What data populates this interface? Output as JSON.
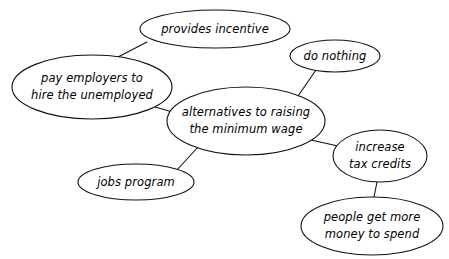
{
  "diagram": {
    "type": "concept-map",
    "background_color": "#ffffff",
    "stroke_color": "#111111",
    "text_color": "#000000",
    "nodes": [
      {
        "id": "provides-incentive",
        "label": "provides incentive",
        "lines": [
          "provides incentive"
        ],
        "cx": 215,
        "cy": 29,
        "rx": 75,
        "ry": 19,
        "font_size": 11.5
      },
      {
        "id": "do-nothing",
        "label": "do nothing",
        "lines": [
          "do nothing"
        ],
        "cx": 335,
        "cy": 56,
        "rx": 45,
        "ry": 16,
        "font_size": 11.5
      },
      {
        "id": "pay-employers",
        "label": "pay employers to hire the unemployed",
        "lines": [
          "pay employers to",
          "hire the unemployed"
        ],
        "cx": 92,
        "cy": 87,
        "rx": 80,
        "ry": 32,
        "font_size": 11.5
      },
      {
        "id": "alternatives-center",
        "label": "alternatives to raising the minimum wage",
        "lines": [
          "alternatives to raising",
          "the minimum wage"
        ],
        "cx": 246,
        "cy": 121,
        "rx": 79,
        "ry": 34,
        "font_size": 11.5
      },
      {
        "id": "increase-tax-credits",
        "label": "increase tax credits",
        "lines": [
          "increase",
          "tax credits"
        ],
        "cx": 380,
        "cy": 156,
        "rx": 47,
        "ry": 26,
        "font_size": 11.5
      },
      {
        "id": "jobs-program",
        "label": "jobs program",
        "lines": [
          "jobs program"
        ],
        "cx": 136,
        "cy": 182,
        "rx": 58,
        "ry": 18,
        "font_size": 11.5
      },
      {
        "id": "people-get-more-money",
        "label": "people get more money to spend",
        "lines": [
          "people get more",
          "money to spend"
        ],
        "cx": 372,
        "cy": 226,
        "rx": 71,
        "ry": 29,
        "font_size": 11.5
      }
    ],
    "edges": [
      {
        "id": "edge-pay-employers-to-provides-incentive",
        "from": "pay-employers",
        "to": "provides-incentive",
        "x1": 118,
        "y1": 57,
        "x2": 147,
        "y2": 42
      },
      {
        "id": "edge-pay-employers-to-center",
        "from": "pay-employers",
        "to": "alternatives-center",
        "x1": 155,
        "y1": 107,
        "x2": 176,
        "y2": 113
      },
      {
        "id": "edge-center-to-do-nothing",
        "from": "alternatives-center",
        "to": "do-nothing",
        "x1": 296,
        "y1": 99,
        "x2": 316,
        "y2": 70
      },
      {
        "id": "edge-center-to-jobs-program",
        "from": "alternatives-center",
        "to": "jobs-program",
        "x1": 199,
        "y1": 146,
        "x2": 176,
        "y2": 171
      },
      {
        "id": "edge-center-to-increase-tax-credits",
        "from": "alternatives-center",
        "to": "increase-tax-credits",
        "x1": 311,
        "y1": 140,
        "x2": 338,
        "y2": 146
      },
      {
        "id": "edge-tax-credits-to-people-money",
        "from": "increase-tax-credits",
        "to": "people-get-more-money",
        "x1": 377,
        "y1": 182,
        "x2": 374,
        "y2": 197
      }
    ]
  }
}
